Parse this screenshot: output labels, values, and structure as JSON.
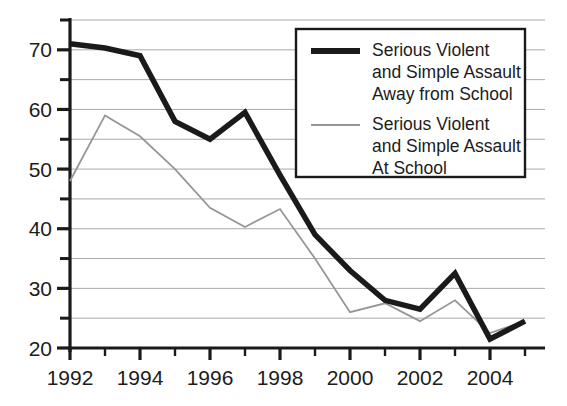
{
  "chart_data": {
    "type": "line",
    "title": "",
    "subtitle": "",
    "xlabel": "",
    "ylabel": "",
    "x": [
      1992,
      1993,
      1994,
      1995,
      1996,
      1997,
      1998,
      1999,
      2000,
      2001,
      2002,
      2003,
      2004,
      2005
    ],
    "xlim": [
      1992,
      2005
    ],
    "ylim": [
      20,
      75
    ],
    "xticks": [
      1992,
      1993,
      1994,
      1995,
      1996,
      1997,
      1998,
      1999,
      2000,
      2001,
      2002,
      2003,
      2004,
      2005
    ],
    "xtick_labels": [
      "1992",
      "",
      "1994",
      "",
      "1996",
      "",
      "1998",
      "",
      "2000",
      "",
      "2002",
      "",
      "2004",
      ""
    ],
    "yticks": [
      20,
      25,
      30,
      35,
      40,
      45,
      50,
      55,
      60,
      65,
      70,
      75
    ],
    "ytick_labels": [
      "20",
      "",
      "30",
      "",
      "40",
      "",
      "50",
      "",
      "60",
      "",
      "70",
      ""
    ],
    "grid": true,
    "grid_axis": "y",
    "legend_position": "upper right",
    "series": [
      {
        "name": "Serious Violent and Simple Assault Away from School",
        "legend_lines": [
          "Serious Violent",
          "and Simple Assault",
          "Away from School"
        ],
        "color": "#1a1a1a",
        "line_width": 5.5,
        "values": [
          71,
          70.3,
          69,
          58,
          55,
          59.5,
          49,
          39,
          33,
          28,
          26.5,
          32.5,
          21.5,
          24.5
        ]
      },
      {
        "name": "Serious Violent and Simple Assault At School",
        "legend_lines": [
          "Serious Violent",
          "and Simple Assault",
          "At School"
        ],
        "color": "#969696",
        "line_width": 1.8,
        "values": [
          48,
          59,
          55.5,
          50,
          43.5,
          40.3,
          43.3,
          35,
          26,
          27.5,
          24.5,
          28,
          22.5,
          24.5
        ]
      }
    ]
  },
  "axes": {
    "y_labels": [
      "70",
      "60",
      "50",
      "40",
      "30",
      "20"
    ],
    "x_labels": [
      "1992",
      "1994",
      "1996",
      "1998",
      "2000",
      "2002",
      "2004"
    ]
  },
  "legend": {
    "series": [
      {
        "swatch": "thick-black-line-swatch",
        "lines": [
          "Serious Violent",
          "and Simple Assault",
          "Away from School"
        ]
      },
      {
        "swatch": "thin-gray-line-swatch",
        "lines": [
          "Serious Violent",
          "and Simple Assault",
          "At School"
        ]
      }
    ]
  },
  "colors": {
    "series_away": "#1a1a1a",
    "series_at_school": "#969696",
    "grid": "#aaaaaa",
    "axis": "#1a1a1a",
    "background": "#ffffff"
  }
}
